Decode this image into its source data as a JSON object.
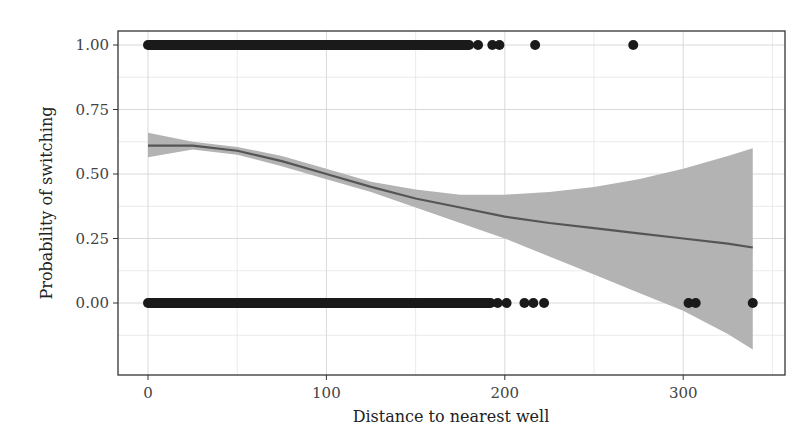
{
  "chart_data": {
    "type": "scatter",
    "title": "",
    "xlabel": "Distance to nearest well",
    "ylabel": "Probability of switching",
    "xlim": [
      -18,
      358
    ],
    "ylim": [
      -0.18,
      1.05
    ],
    "x_ticks": [
      0,
      100,
      200,
      300
    ],
    "x_tick_labels": [
      "0",
      "100",
      "200",
      "300"
    ],
    "y_ticks": [
      0,
      0.25,
      0.5,
      0.75,
      1
    ],
    "y_tick_labels": [
      "0.00",
      "0.25",
      "0.50",
      "0.75",
      "1.00"
    ],
    "grid": true,
    "legend": "none",
    "series": [
      {
        "name": "switched (y=1)",
        "kind": "points",
        "dense_range": [
          0,
          180
        ],
        "x": [
          185,
          193,
          197,
          217,
          272
        ],
        "y": [
          1,
          1,
          1,
          1,
          1
        ]
      },
      {
        "name": "not switched (y=0)",
        "kind": "points",
        "dense_range": [
          0,
          192
        ],
        "x": [
          196,
          201,
          211,
          216,
          222,
          303,
          307,
          339
        ],
        "y": [
          0,
          0,
          0,
          0,
          0,
          0,
          0,
          0
        ]
      },
      {
        "name": "smooth fit",
        "kind": "line",
        "x": [
          0,
          25,
          50,
          75,
          100,
          125,
          150,
          175,
          200,
          225,
          250,
          275,
          300,
          325,
          339
        ],
        "y": [
          0.61,
          0.61,
          0.59,
          0.55,
          0.5,
          0.45,
          0.405,
          0.37,
          0.335,
          0.31,
          0.29,
          0.27,
          0.25,
          0.23,
          0.215
        ]
      },
      {
        "name": "confidence band",
        "kind": "ribbon",
        "x": [
          0,
          25,
          50,
          75,
          100,
          125,
          150,
          175,
          200,
          225,
          250,
          275,
          300,
          325,
          339
        ],
        "upper": [
          0.66,
          0.625,
          0.605,
          0.57,
          0.52,
          0.47,
          0.44,
          0.42,
          0.42,
          0.43,
          0.45,
          0.48,
          0.52,
          0.57,
          0.6
        ],
        "lower": [
          0.565,
          0.595,
          0.575,
          0.53,
          0.48,
          0.43,
          0.37,
          0.31,
          0.25,
          0.18,
          0.11,
          0.04,
          -0.03,
          -0.12,
          -0.18
        ]
      }
    ],
    "colors": {
      "points": "#1a1a1a",
      "line": "#555555",
      "ribbon": "#b3b3b3",
      "grid": "#d9d9d9",
      "panel_border": "#333333"
    }
  }
}
